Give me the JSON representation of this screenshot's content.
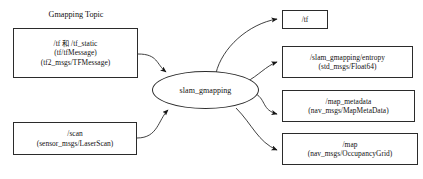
{
  "diagram": {
    "type": "ros-node-graph",
    "group_title": "Gmapping Topic",
    "colors": {
      "background": "#ffffff",
      "stroke": "#2b2b2b",
      "text": "#111111"
    },
    "inputs": [
      {
        "id": "tf-input",
        "lines": [
          "/tf 和 /tf_static",
          "(tf/tfMessage)",
          "(tf2_msgs/TFMessage)"
        ]
      },
      {
        "id": "scan-input",
        "lines": [
          "/scan",
          "(sensor_msgs/LaserScan)"
        ]
      }
    ],
    "process": {
      "id": "slam-gmapping",
      "label": "slam_gmapping"
    },
    "outputs": [
      {
        "id": "tf-output",
        "lines": [
          "/tf"
        ]
      },
      {
        "id": "entropy-output",
        "lines": [
          "/slam_gmapping/entropy",
          "(std_msgs/Float64)"
        ]
      },
      {
        "id": "map-metadata-output",
        "lines": [
          "/map_metadata",
          "(nav_msgs/MapMetaData)"
        ]
      },
      {
        "id": "map-output",
        "lines": [
          "/map",
          "(nav_msgs/OccupancyGrid)"
        ]
      }
    ],
    "edges": [
      {
        "id": "edge-tf-to-slam",
        "from": "tf-input",
        "to": "slam-gmapping"
      },
      {
        "id": "edge-scan-to-slam",
        "from": "scan-input",
        "to": "slam-gmapping"
      },
      {
        "id": "edge-slam-to-tf",
        "from": "slam-gmapping",
        "to": "tf-output"
      },
      {
        "id": "edge-slam-to-entropy",
        "from": "slam-gmapping",
        "to": "entropy-output"
      },
      {
        "id": "edge-slam-to-metadata",
        "from": "slam-gmapping",
        "to": "map-metadata-output"
      },
      {
        "id": "edge-slam-to-map",
        "from": "slam-gmapping",
        "to": "map-output"
      }
    ]
  }
}
